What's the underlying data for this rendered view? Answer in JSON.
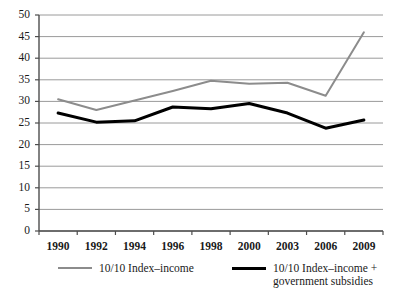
{
  "chart_data": {
    "type": "line",
    "title": "",
    "subtitle": "",
    "xlabel": "",
    "ylabel": "",
    "categories": [
      "1990",
      "1992",
      "1994",
      "1996",
      "1998",
      "2000",
      "2003",
      "2006",
      "2009"
    ],
    "ylim": [
      0,
      50
    ],
    "ytick_step": 5,
    "yticks": [
      "50",
      "45",
      "40",
      "35",
      "30",
      "25",
      "20",
      "15",
      "10",
      "5",
      "0"
    ],
    "grid": true,
    "grid_axis": "y",
    "legend_position": "bottom",
    "series": [
      {
        "name": "10/10 Index–income",
        "color": "#8c8c8c",
        "line_width": 2,
        "values": [
          30.5,
          28.0,
          30.2,
          32.4,
          34.8,
          34.1,
          34.3,
          31.3,
          46.0
        ]
      },
      {
        "name": "10/10 Index–income +\ngovernment subsidies",
        "color": "#000000",
        "line_width": 3,
        "values": [
          27.3,
          25.2,
          25.5,
          28.7,
          28.3,
          29.5,
          27.3,
          23.8,
          25.7
        ]
      }
    ]
  },
  "legend": {
    "items": [
      {
        "label": "10/10 Index–income",
        "swatch": "gray-line-swatch"
      },
      {
        "label": "10/10 Index–income +\ngovernment subsidies",
        "swatch": "black-line-swatch"
      }
    ]
  },
  "colors": {
    "series_gray": "#8c8c8c",
    "series_black": "#000000",
    "grid": "#9a9a9a",
    "axis": "#4d4d4d",
    "text": "#1a1a1a",
    "background": "#ffffff"
  }
}
